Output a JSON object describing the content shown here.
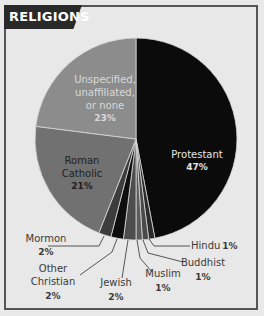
{
  "header": {
    "title": "RELIGIONS"
  },
  "colors": {
    "background": "#e8e8e8",
    "frame_border": "#555555",
    "header_bg": "#2a2a2a",
    "protestant": "#0b0b0b",
    "hindu": "#2b2b2b",
    "buddhist": "#4a4a4a",
    "muslim": "#5c5c5c",
    "jewish": "#4d4d4d",
    "other_christian": "#0e0e0e",
    "mormon": "#3c3c3c",
    "roman_catholic": "#717171",
    "unspecified": "#8c8c8c"
  },
  "chart_data": {
    "type": "pie",
    "title": "RELIGIONS",
    "start_angle": "12 o'clock, clockwise",
    "categories": [
      "Protestant",
      "Hindu",
      "Buddhist",
      "Muslim",
      "Jewish",
      "Other Christian",
      "Mormon",
      "Roman Catholic",
      "Unspecified, unaffiliated, or none"
    ],
    "values": [
      47,
      1,
      1,
      1,
      2,
      2,
      2,
      21,
      23
    ],
    "unit": "%",
    "legend": "none (direct labels)"
  },
  "labels": {
    "protestant": {
      "name": "Protestant",
      "pct": "47%"
    },
    "unspecified": {
      "line1": "Unspecified,",
      "line2": "unaffiliated,",
      "line3": "or none",
      "pct": "23%"
    },
    "roman_catholic": {
      "line1": "Roman",
      "line2": "Catholic",
      "pct": "21%"
    },
    "mormon": {
      "name": "Mormon",
      "pct": "2%"
    },
    "other_christian": {
      "line1": "Other",
      "line2": "Christian",
      "pct": "2%"
    },
    "jewish": {
      "name": "Jewish",
      "pct": "2%"
    },
    "muslim": {
      "name": "Muslim",
      "pct": "1%"
    },
    "buddhist": {
      "name": "Buddhist",
      "pct": "1%"
    },
    "hindu": {
      "name": "Hindu",
      "pct": "1%"
    }
  }
}
